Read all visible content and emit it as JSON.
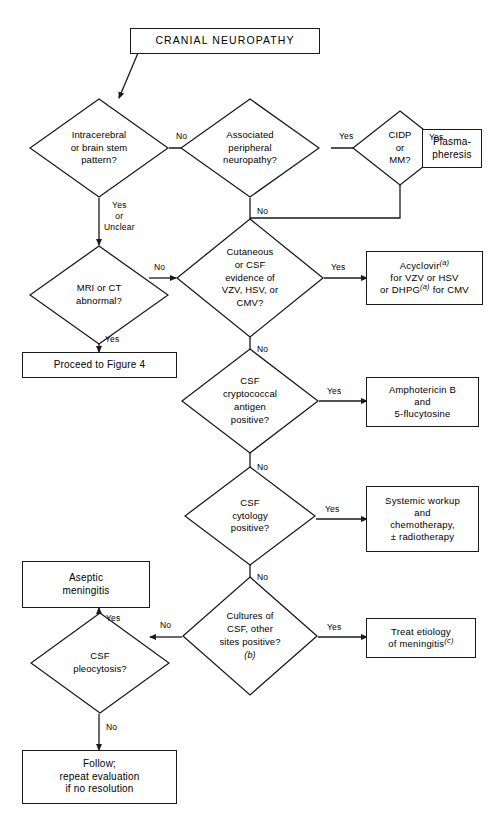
{
  "figure": {
    "title_box": "CRANIAL NEUROPATHY",
    "type": "clinical-decision-flowchart"
  },
  "nodes": {
    "start": {
      "label": "CRANIAL NEUROPATHY"
    },
    "d_intracerebral": {
      "label": "Intracerebral\nor brain stem\npattern?"
    },
    "d_peripheral": {
      "label": "Associated\nperipheral\nneuropathy?"
    },
    "d_cidp": {
      "label": "CIDP\nor\nMM?"
    },
    "b_plasma": {
      "label": "Plasma-\npheresis"
    },
    "d_mri": {
      "label": "MRI or CT\nabnormal?"
    },
    "d_cutaneous": {
      "label": "Cutaneous\nor CSF\nevidence of\nVZV, HSV, or\nCMV?"
    },
    "b_acyclovir": {
      "line1": "Acyclovir",
      "fn1": "(a)",
      "line2": "for VZV or HSV",
      "line3a": "or DHPG",
      "fn2": "(a)",
      "line3b": " for CMV"
    },
    "b_figure4": {
      "label": "Proceed to Figure 4"
    },
    "d_crypto": {
      "label": "CSF\ncryptococcal\nantigen\npositive?"
    },
    "b_ampho": {
      "label": "Amphotericin B\nand\n5-flucytosine"
    },
    "d_cytology": {
      "label": "CSF\ncytology\npositive?"
    },
    "b_systemic": {
      "label": "Systemic workup\nand\nchemotherapy,\n± radiotherapy"
    },
    "b_aseptic": {
      "label": "Aseptic\nmeningitis"
    },
    "d_cultures": {
      "label": "Cultures of\nCSF, other\nsites positive?",
      "footnote": "(b)"
    },
    "b_treat": {
      "line1": "Treat etiology",
      "line2a": "of meningitis",
      "fn": "(c)"
    },
    "d_pleocytosis": {
      "label": "CSF\npleocytosis?"
    },
    "b_follow": {
      "label": "Follow;\nrepeat evaluation\nif no resolution"
    }
  },
  "edge_labels": {
    "intracerebral_no": "No",
    "intracerebral_yes": "Yes\nor\nUnclear",
    "peripheral_yes": "Yes",
    "peripheral_no": "No",
    "cidp_yes": "Yes",
    "mri_no": "No",
    "mri_yes": "Yes",
    "cutaneous_yes": "Yes",
    "cutaneous_no": "No",
    "crypto_yes": "Yes",
    "crypto_no": "No",
    "cytology_yes": "Yes",
    "cytology_no": "No",
    "cultures_yes": "Yes",
    "cultures_no": "No",
    "pleocytosis_yes": "Yes",
    "pleocytosis_no": "No"
  },
  "colors": {
    "stroke": "#1a1a1a",
    "background": "#ffffff",
    "text": "#000000"
  }
}
